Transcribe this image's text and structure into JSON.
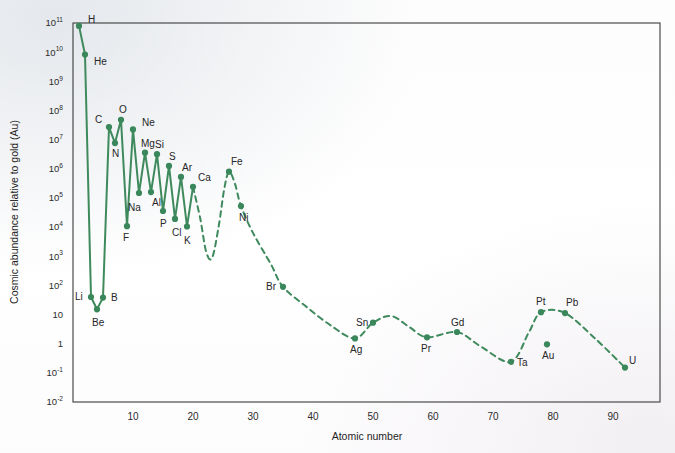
{
  "chart_data": {
    "type": "line",
    "title": "",
    "xlabel": "Atomic number",
    "ylabel": "Cosmic abundance relative to gold (Au)",
    "xlim": [
      -2,
      98
    ],
    "ylim": [
      -2,
      11
    ],
    "y_scale": "log",
    "grid": false,
    "legend": "none",
    "accent_color": "#3e8a5c",
    "y_tick_labels": [
      "10¹¹",
      "10¹⁰",
      "10⁹",
      "10⁸",
      "10⁷",
      "10⁶",
      "10⁵",
      "10⁴",
      "10³",
      "10²",
      "10",
      "1",
      "10⁻¹",
      "10⁻²"
    ],
    "y_tick_bases": [
      "10",
      "10",
      "10",
      "10",
      "10",
      "10",
      "10",
      "10",
      "10",
      "10",
      "10",
      "1",
      "10",
      "10"
    ],
    "y_tick_exponents": [
      "11",
      "10",
      "9",
      "8",
      "7",
      "6",
      "5",
      "4",
      "3",
      "2",
      "",
      "",
      "-1",
      "-2"
    ],
    "y_tick_exponent_values": [
      11,
      10,
      9,
      8,
      7,
      6,
      5,
      4,
      3,
      2,
      1,
      0,
      -1,
      -2
    ],
    "x_tick_labels": [
      "10",
      "20",
      "30",
      "40",
      "50",
      "60",
      "70",
      "80",
      "90"
    ],
    "x_tick_values": [
      10,
      20,
      30,
      40,
      50,
      60,
      70,
      80,
      90
    ],
    "series": [
      {
        "name": "Cosmic abundance",
        "style_solid_range": [
          1,
          20
        ],
        "points": [
          {
            "label": "H",
            "z": 1,
            "log_y": 10.9,
            "lx": 9,
            "ly": -3
          },
          {
            "label": "He",
            "z": 2,
            "log_y": 9.92,
            "lx": 9,
            "ly": 10
          },
          {
            "label": "Li",
            "z": 3,
            "log_y": 1.6,
            "lx": -16,
            "ly": 3
          },
          {
            "label": "Be",
            "z": 4,
            "log_y": 1.18,
            "lx": -5,
            "ly": 17
          },
          {
            "label": "B",
            "z": 5,
            "log_y": 1.58,
            "lx": 8,
            "ly": 3
          },
          {
            "label": "C",
            "z": 6,
            "log_y": 7.43,
            "lx": -14,
            "ly": -4
          },
          {
            "label": "N",
            "z": 7,
            "log_y": 6.88,
            "lx": -3,
            "ly": 14
          },
          {
            "label": "O",
            "z": 8,
            "log_y": 7.68,
            "lx": -2,
            "ly": -7
          },
          {
            "label": "F",
            "z": 9,
            "log_y": 4.03,
            "lx": -4,
            "ly": 15
          },
          {
            "label": "Ne",
            "z": 10,
            "log_y": 7.35,
            "lx": 9,
            "ly": -3
          },
          {
            "label": "Na",
            "z": 11,
            "log_y": 5.17,
            "lx": -11,
            "ly": 18
          },
          {
            "label": "Mg",
            "z": 12,
            "log_y": 6.55,
            "lx": -4,
            "ly": -6
          },
          {
            "label": "Al",
            "z": 13,
            "log_y": 5.2,
            "lx": 1,
            "ly": 14
          },
          {
            "label": "Si",
            "z": 14,
            "log_y": 6.5,
            "lx": -2,
            "ly": -6
          },
          {
            "label": "P",
            "z": 15,
            "log_y": 4.55,
            "lx": -3,
            "ly": 16
          },
          {
            "label": "S",
            "z": 16,
            "log_y": 6.1,
            "lx": 0,
            "ly": -6
          },
          {
            "label": "Cl",
            "z": 17,
            "log_y": 4.28,
            "lx": -3,
            "ly": 17
          },
          {
            "label": "Ar",
            "z": 18,
            "log_y": 5.72,
            "lx": 1,
            "ly": -6
          },
          {
            "label": "K",
            "z": 19,
            "log_y": 4.02,
            "lx": -3,
            "ly": 17
          },
          {
            "label": "Ca",
            "z": 20,
            "log_y": 5.38,
            "lx": 5,
            "ly": -6
          },
          {
            "label": "Fe",
            "z": 26,
            "log_y": 5.9,
            "lx": 2,
            "ly": -7
          },
          {
            "label": "Ni",
            "z": 28,
            "log_y": 4.72,
            "lx": -2,
            "ly": 15
          },
          {
            "label": "Br",
            "z": 35,
            "log_y": 1.95,
            "lx": -17,
            "ly": 3
          },
          {
            "label": "Ag",
            "z": 47,
            "log_y": 0.18,
            "lx": -5,
            "ly": 15
          },
          {
            "label": "Sn",
            "z": 50,
            "log_y": 0.72,
            "lx": -17,
            "ly": 3
          },
          {
            "label": "Pr",
            "z": 59,
            "log_y": 0.22,
            "lx": -6,
            "ly": 15
          },
          {
            "label": "Gd",
            "z": 64,
            "log_y": 0.4,
            "lx": -6,
            "ly": -6
          },
          {
            "label": "Ta",
            "z": 73,
            "log_y": -0.62,
            "lx": 6,
            "ly": 4
          },
          {
            "label": "Pt",
            "z": 78,
            "log_y": 1.08,
            "lx": -5,
            "ly": -7
          },
          {
            "label": "Au",
            "z": 79,
            "log_y": -0.02,
            "lx": -5,
            "ly": 15
          },
          {
            "label": "Pb",
            "z": 82,
            "log_y": 1.05,
            "lx": 1,
            "ly": -7
          },
          {
            "label": "U",
            "z": 92,
            "log_y": -0.82,
            "lx": 4,
            "ly": -4
          }
        ],
        "dashed_guide_nodes": [
          {
            "z": 20,
            "log_y": 5.38
          },
          {
            "z": 21.2,
            "log_y": 4.3
          },
          {
            "z": 22.2,
            "log_y": 3.15
          },
          {
            "z": 23.2,
            "log_y": 2.95
          },
          {
            "z": 24.3,
            "log_y": 4.05
          },
          {
            "z": 25.2,
            "log_y": 5.3
          },
          {
            "z": 26,
            "log_y": 5.9
          },
          {
            "z": 27,
            "log_y": 5.48
          },
          {
            "z": 28,
            "log_y": 4.72
          },
          {
            "z": 30,
            "log_y": 3.8
          },
          {
            "z": 33,
            "log_y": 2.72
          },
          {
            "z": 35,
            "log_y": 1.95
          },
          {
            "z": 39,
            "log_y": 1.25
          },
          {
            "z": 43,
            "log_y": 0.62
          },
          {
            "z": 47,
            "log_y": 0.18
          },
          {
            "z": 50,
            "log_y": 0.72
          },
          {
            "z": 53,
            "log_y": 0.95
          },
          {
            "z": 56,
            "log_y": 0.58
          },
          {
            "z": 59,
            "log_y": 0.22
          },
          {
            "z": 64,
            "log_y": 0.4
          },
          {
            "z": 68,
            "log_y": -0.1
          },
          {
            "z": 73,
            "log_y": -0.62
          },
          {
            "z": 76,
            "log_y": 0.4
          },
          {
            "z": 78,
            "log_y": 1.08
          },
          {
            "z": 82,
            "log_y": 1.05
          },
          {
            "z": 87,
            "log_y": 0.18
          },
          {
            "z": 92,
            "log_y": -0.82
          }
        ]
      }
    ]
  },
  "axes": {
    "x_title": "Atomic number",
    "y_title": "Cosmic abundance relative to gold (Au)"
  }
}
